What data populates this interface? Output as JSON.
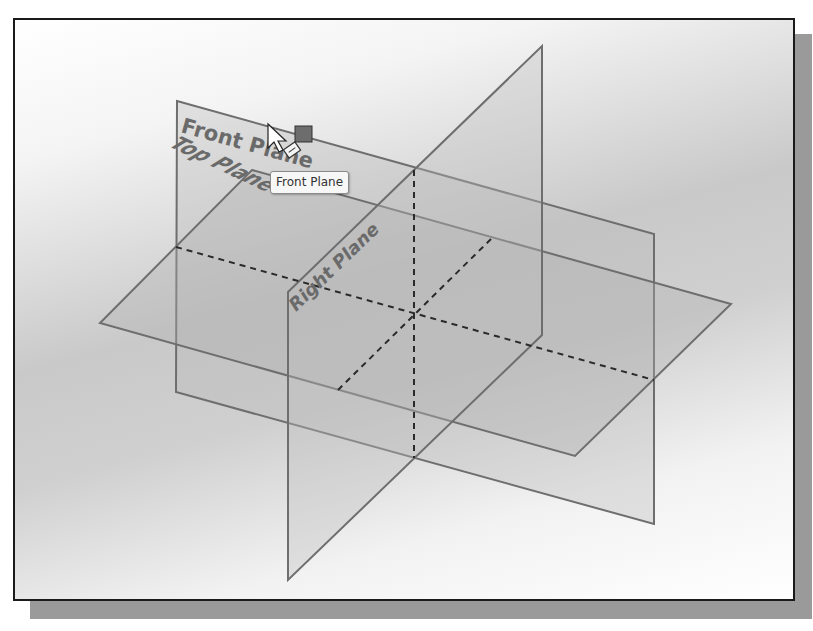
{
  "viewport": {
    "background": "gradient gray",
    "frame_color": "#1a1a1a",
    "shadow_color": "#9a9a9a"
  },
  "planes": {
    "front": {
      "label": "Front Plane"
    },
    "top": {
      "label": "Top Plane"
    },
    "right": {
      "label": "Right Plane"
    }
  },
  "tooltip": {
    "text": "Front Plane"
  },
  "cursor": {
    "icon": "arrow-cursor-icon",
    "badge": "plane-icon"
  },
  "colors": {
    "plane_edge": "#6e6e6e",
    "plane_fill": "#b9b9b9",
    "dash": "#2a2a2a"
  }
}
